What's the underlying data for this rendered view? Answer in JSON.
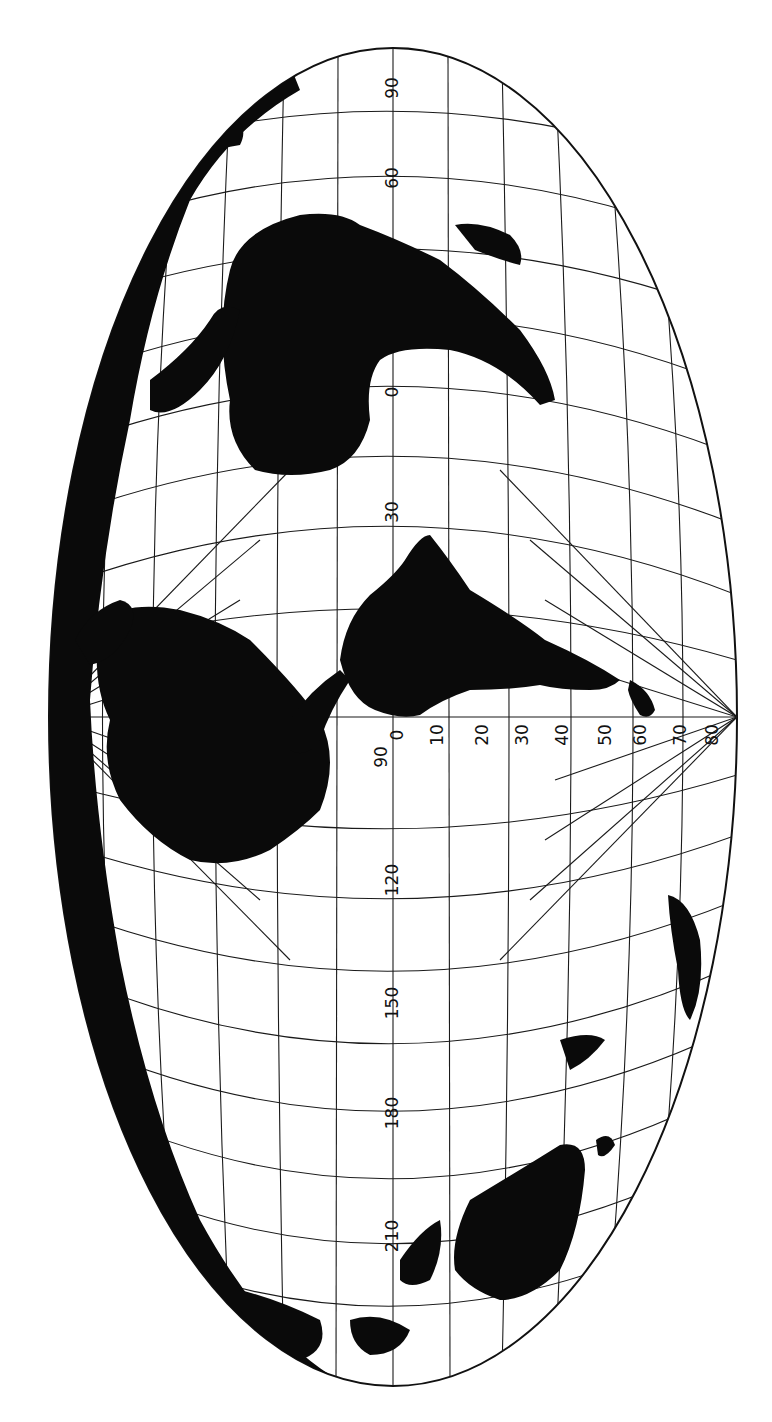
{
  "map": {
    "projection": "oblique elliptical world projection (rotated 90°)",
    "colors": {
      "land": "#0a0a0a",
      "ocean": "#ffffff",
      "graticule": "#1a1a1a"
    },
    "meridian_labels_axis": [
      "90",
      "60",
      "0",
      "30",
      "90",
      "120",
      "150",
      "180",
      "210"
    ],
    "central_axis_labels": [
      {
        "text": "90",
        "x": 392,
        "y": 88
      },
      {
        "text": "60",
        "x": 392,
        "y": 178
      },
      {
        "text": "0",
        "x": 392,
        "y": 392
      },
      {
        "text": "30",
        "x": 392,
        "y": 512
      },
      {
        "text": "90",
        "x": 382,
        "y": 757
      },
      {
        "text": "120",
        "x": 392,
        "y": 880
      },
      {
        "text": "150",
        "x": 392,
        "y": 1003
      },
      {
        "text": "180",
        "x": 392,
        "y": 1113
      },
      {
        "text": "210",
        "x": 392,
        "y": 1236
      }
    ],
    "equator_labels": [
      {
        "text": "0",
        "x": 397,
        "y": 735
      },
      {
        "text": "10",
        "x": 437,
        "y": 735
      },
      {
        "text": "20",
        "x": 482,
        "y": 735
      },
      {
        "text": "30",
        "x": 522,
        "y": 735
      },
      {
        "text": "40",
        "x": 562,
        "y": 735
      },
      {
        "text": "50",
        "x": 605,
        "y": 735
      },
      {
        "text": "60",
        "x": 640,
        "y": 735
      },
      {
        "text": "70",
        "x": 680,
        "y": 735
      },
      {
        "text": "80",
        "x": 712,
        "y": 735
      }
    ]
  }
}
